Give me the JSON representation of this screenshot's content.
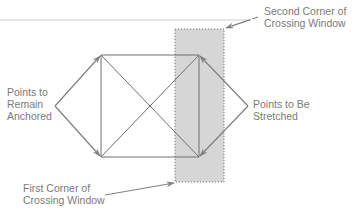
{
  "diagram": {
    "labels": {
      "second_corner": "Second Corner of\nCrossing Window",
      "anchored": "Points to\nRemain\nAnchored",
      "stretched": "Points to Be\nStretched",
      "first_corner": "First Corner of\nCrossing Window"
    },
    "shape": {
      "rectangle": {
        "x1": 101,
        "y1": 55,
        "x2": 199,
        "y2": 157
      },
      "diagonals": true
    },
    "crossing_window": {
      "x1": 175,
      "y1": 29,
      "x2": 224,
      "y2": 182,
      "fill": "#d6d6d6",
      "border_style": "dotted"
    },
    "colors": {
      "line": "#6e6e6e",
      "arrow": "#808080",
      "text": "#7a7a7a",
      "window_fill": "#d6d6d6",
      "window_border": "#777777",
      "top_rule": "#e6e6e6"
    }
  }
}
